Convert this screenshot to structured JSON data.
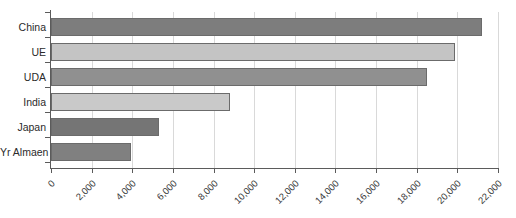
{
  "chart_data": {
    "type": "bar",
    "orientation": "horizontal",
    "title": "",
    "subtitle": "",
    "xlabel": "",
    "ylabel": "",
    "categories": [
      "China",
      "UE",
      "UDA",
      "India",
      "Japan",
      "Yr Almaen"
    ],
    "values": [
      21200,
      19900,
      18500,
      8800,
      5300,
      3950
    ],
    "series": [
      {
        "name": "",
        "values": [
          21200,
          19900,
          18500,
          8800,
          5300,
          3950
        ]
      }
    ],
    "bar_colors": [
      "#7d7d7d",
      "#c4c4c4",
      "#909090",
      "#c9c9c9",
      "#757575",
      "#808080"
    ],
    "bar_border_color": "#6b6b6b",
    "xlim": [
      0,
      22000
    ],
    "xtick_labels": [
      "0",
      "2,000",
      "4,000",
      "6,000",
      "8,000",
      "10,000",
      "12,000",
      "14,000",
      "16,000",
      "18,000",
      "20,000",
      "22,000"
    ],
    "xtick_values": [
      0,
      2000,
      4000,
      6000,
      8000,
      10000,
      12000,
      14000,
      16000,
      18000,
      20000,
      22000
    ],
    "xtick_rotation": -45,
    "grid": {
      "vertical": true,
      "horizontal": false,
      "color": "#d9d9d9"
    },
    "legend": {
      "visible": false,
      "position": "none",
      "entries": []
    },
    "axis_color": "#5b5b5b",
    "background": "#ffffff",
    "annotations": []
  }
}
